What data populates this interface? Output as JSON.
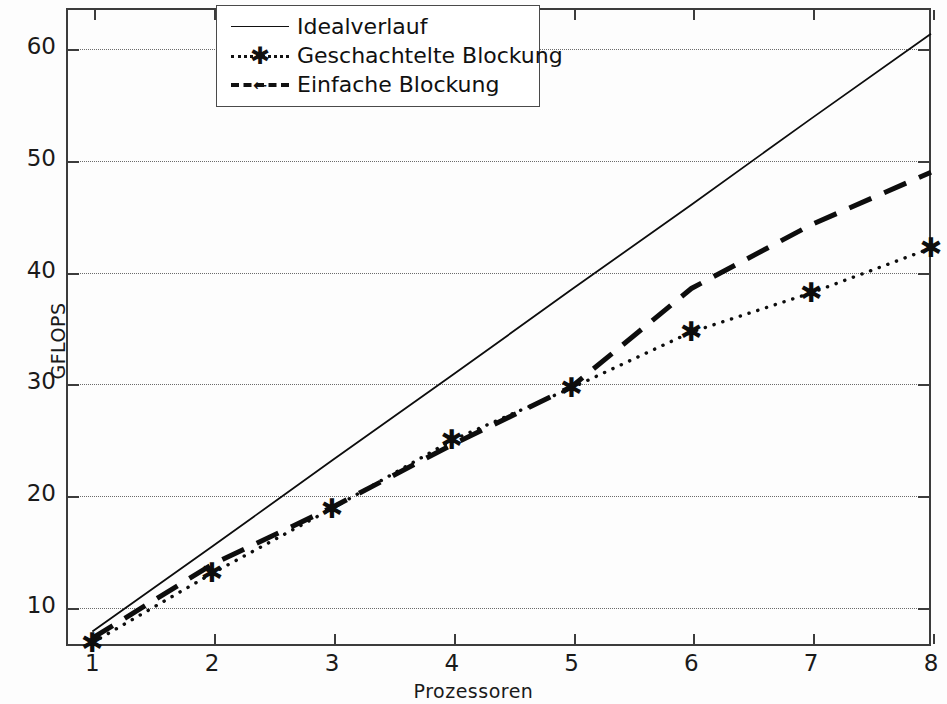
{
  "figure": {
    "background": "#fdfdfd",
    "foreground": "#1a1a1a",
    "grid_color": "#6b6b6b"
  },
  "axes": {
    "x_label": "Prozessoren",
    "y_label": "GFLOPS",
    "x_ticks": [
      "1",
      "2",
      "3",
      "4",
      "5",
      "6",
      "7",
      "8"
    ],
    "y_ticks": [
      "10",
      "20",
      "30",
      "40",
      "50",
      "60"
    ]
  },
  "legend": {
    "items": [
      {
        "label": "Idealverlauf",
        "style": "solid",
        "marker": "none"
      },
      {
        "label": "Geschachtelte  Blockung",
        "style": "dotted",
        "marker": "star"
      },
      {
        "label": "Einfache Blockung",
        "style": "dashed",
        "marker": "arrow"
      }
    ],
    "marker_glyph_star": "✱",
    "marker_glyph_arrow": "←"
  },
  "chart_data": {
    "type": "line",
    "title": "",
    "xlabel": "Prozessoren",
    "ylabel": "GFLOPS",
    "x": [
      1,
      2,
      3,
      4,
      5,
      6,
      7,
      8
    ],
    "xlim": [
      0.78,
      8.0
    ],
    "ylim": [
      6.4,
      63.5
    ],
    "xticks": [
      1,
      2,
      3,
      4,
      5,
      6,
      7,
      8
    ],
    "yticks": [
      10,
      20,
      30,
      40,
      50,
      60
    ],
    "grid": true,
    "grid_axis": "y",
    "legend_position": "top-center",
    "series": [
      {
        "name": "Idealverlauf",
        "style": "solid",
        "marker": "none",
        "values": [
          7.7,
          15.3,
          23.0,
          30.6,
          38.3,
          45.9,
          53.6,
          61.2
        ]
      },
      {
        "name": "Geschachtelte  Blockung",
        "style": "dotted",
        "marker": "star",
        "values": [
          6.7,
          12.9,
          18.7,
          24.8,
          29.5,
          34.5,
          38.0,
          42.0
        ]
      },
      {
        "name": "Einfache Blockung",
        "style": "dashed",
        "marker": "none",
        "values": [
          7.1,
          13.7,
          18.8,
          24.4,
          29.6,
          38.4,
          44.1,
          48.8
        ]
      }
    ]
  }
}
